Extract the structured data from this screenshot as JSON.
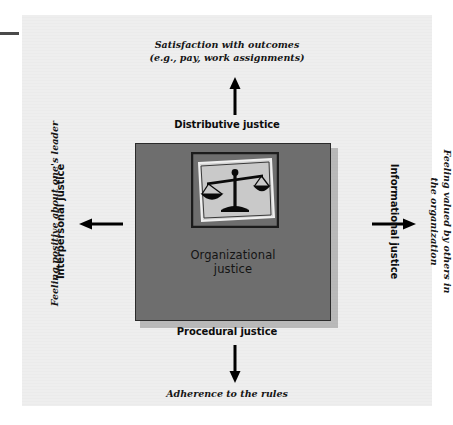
{
  "figure": {
    "center": {
      "title_line1": "Organizational",
      "title_line2": "justice",
      "icon": "scales-of-justice-icon"
    },
    "dimensions": [
      {
        "id": "distributive",
        "label": "Distributive justice",
        "position": "top",
        "arrow": "arrow-up-icon",
        "outcome_line1": "Satisfaction with outcomes",
        "outcome_line2": "(e.g., pay, work assignments)"
      },
      {
        "id": "procedural",
        "label": "Procedural justice",
        "position": "bottom",
        "arrow": "arrow-down-icon",
        "outcome_line1": "Adherence to the rules",
        "outcome_line2": ""
      },
      {
        "id": "interpersonal",
        "label": "Interpersonal justice",
        "position": "left",
        "arrow": "arrow-left-icon",
        "outcome_line1": "Feeling positive about one's leader",
        "outcome_line2": ""
      },
      {
        "id": "informational",
        "label": "Informational justice",
        "position": "right",
        "arrow": "arrow-right-icon",
        "outcome_line1": "Feeling valued by others in",
        "outcome_line2": "the organization"
      }
    ],
    "colors": {
      "panel_background": "#eeeeee",
      "core_box": "#6e6e6e",
      "core_border": "#2b2b2b",
      "arrow": "#000000",
      "icon_frame": "#222222",
      "icon_paper": "#c9c9c9",
      "margin_rule": "#4a4a4a"
    }
  }
}
